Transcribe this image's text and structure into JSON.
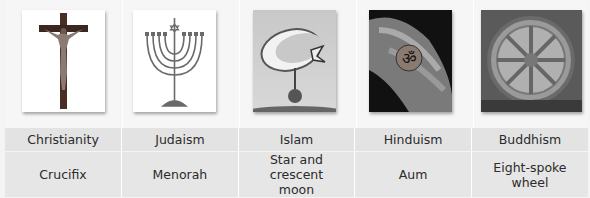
{
  "religions": [
    {
      "name": "Christianity",
      "symbol": "Crucifix",
      "image": "crucifix-image"
    },
    {
      "name": "Judaism",
      "symbol": "Menorah",
      "image": "menorah-image"
    },
    {
      "name": "Islam",
      "symbol": "Star and crescent moon",
      "image": "star-crescent-image"
    },
    {
      "name": "Hinduism",
      "symbol": "Aum",
      "image": "aum-image"
    },
    {
      "name": "Buddhism",
      "symbol": "Eight-spoke wheel",
      "image": "dharma-wheel-image"
    }
  ],
  "colors": {
    "row_background": "#e3e3e3",
    "page_background": "#f4f4f4",
    "text": "#2b2b2b"
  }
}
